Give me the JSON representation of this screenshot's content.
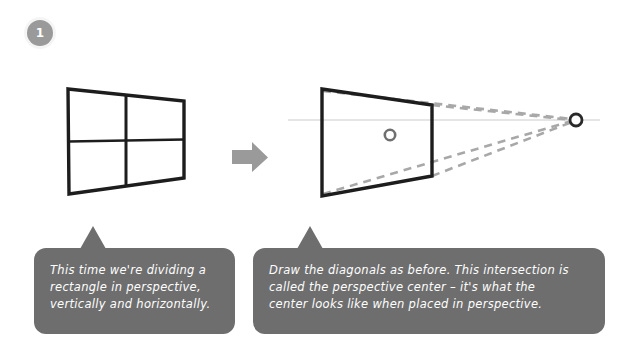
{
  "step": {
    "number": "1"
  },
  "arrow": {
    "direction": "right",
    "color": "#9a9a9a"
  },
  "colors": {
    "shape_stroke": "#1d1d1d",
    "guide_dashed": "#a8a8a8",
    "horizon_line": "#d6d6d6",
    "bubble_fill": "#6e6e6e",
    "bubble_text": "#ffffff",
    "badge_fill": "#9a9a9a",
    "background": "#ffffff"
  },
  "diagram_left": {
    "name": "rectangle-in-perspective-divided",
    "corners": {
      "top_left": [
        68,
        89
      ],
      "top_right": [
        184,
        101
      ],
      "bottom_right": [
        184,
        178
      ],
      "bottom_left": [
        69,
        194
      ]
    },
    "dividers": [
      "vertical-midline",
      "horizontal-midline"
    ]
  },
  "diagram_right": {
    "name": "rectangle-with-diagonals-and-vanishing-point",
    "corners": {
      "top_left": [
        322,
        89
      ],
      "top_right": [
        432,
        105
      ],
      "bottom_right": [
        432,
        176
      ],
      "bottom_left": [
        322,
        196
      ]
    },
    "perspective_center": [
      390,
      135
    ],
    "vanishing_point": [
      575,
      120
    ],
    "horizon_line_y": 120,
    "guides": [
      "diagonal-tl-br",
      "diagonal-bl-tr",
      "edge-to-vp-top",
      "edge-to-vp-bottom",
      "corner-bl-to-vp",
      "corner-tl-to-vp"
    ]
  },
  "bubbles": {
    "left": {
      "text": "This time we're dividing a\nrectangle in perspective,\nvertically and horizontally."
    },
    "right": {
      "text": "Draw the diagonals as before. This intersection is\ncalled the perspective center – it's what the\ncenter looks like when placed in perspective."
    }
  }
}
